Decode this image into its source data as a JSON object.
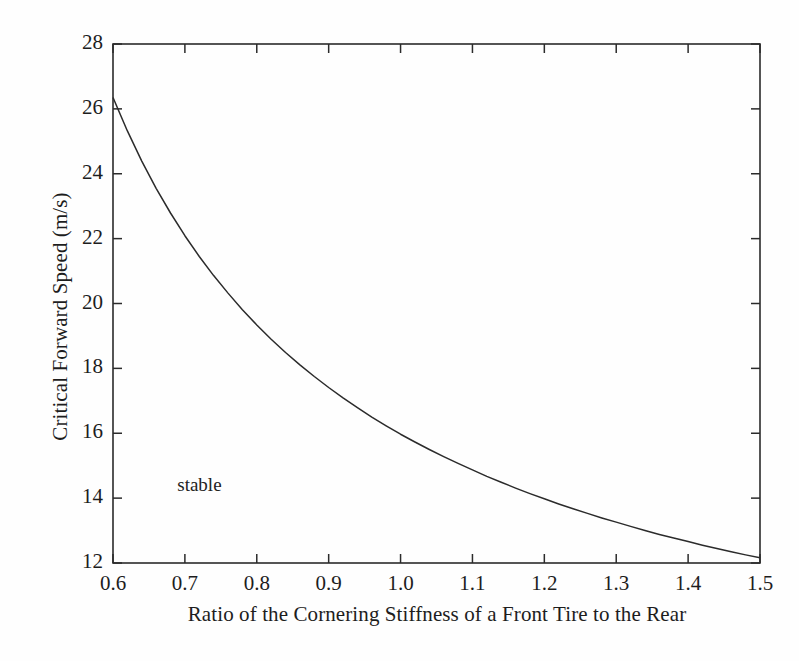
{
  "figure": {
    "background_color": "#fefefe",
    "line_color": "#2b2b2b",
    "axis_color": "#2b2b2b"
  },
  "annotations": [
    {
      "text": "stable",
      "x": 0.72,
      "y": 14.35
    }
  ],
  "chart_data": {
    "type": "line",
    "title": "",
    "xlabel": "Ratio of the Cornering Stiffness of a Front Tire to the Rear",
    "ylabel": "Critical Forward Speed (m/s)",
    "xlim": [
      0.6,
      1.5
    ],
    "ylim": [
      12,
      28
    ],
    "xticks": [
      0.6,
      0.7,
      0.8,
      0.9,
      1.0,
      1.1,
      1.2,
      1.3,
      1.4,
      1.5
    ],
    "xtick_labels": [
      "0.6",
      "0.7",
      "0.8",
      "0.9",
      "1.0",
      "1.1",
      "1.2",
      "1.3",
      "1.4",
      "1.5"
    ],
    "yticks": [
      12,
      14,
      16,
      18,
      20,
      22,
      24,
      26,
      28
    ],
    "ytick_labels": [
      "12",
      "14",
      "16",
      "18",
      "20",
      "22",
      "24",
      "26",
      "28"
    ],
    "grid": false,
    "legend": null,
    "series": [
      {
        "name": "critical forward speed",
        "x": [
          0.6,
          0.62,
          0.64,
          0.66,
          0.68,
          0.7,
          0.72,
          0.74,
          0.76,
          0.78,
          0.8,
          0.82,
          0.84,
          0.86,
          0.88,
          0.9,
          0.92,
          0.94,
          0.96,
          0.98,
          1.0,
          1.02,
          1.04,
          1.06,
          1.08,
          1.1,
          1.12,
          1.14,
          1.16,
          1.18,
          1.2,
          1.22,
          1.24,
          1.26,
          1.28,
          1.3,
          1.32,
          1.34,
          1.36,
          1.38,
          1.4,
          1.42,
          1.44,
          1.46,
          1.48,
          1.5
        ],
        "y": [
          26.35,
          25.32,
          24.39,
          23.55,
          22.79,
          22.09,
          21.45,
          20.86,
          20.32,
          19.81,
          19.34,
          18.9,
          18.49,
          18.11,
          17.75,
          17.41,
          17.09,
          16.79,
          16.5,
          16.23,
          15.97,
          15.73,
          15.5,
          15.28,
          15.07,
          14.87,
          14.67,
          14.49,
          14.31,
          14.14,
          13.98,
          13.82,
          13.67,
          13.53,
          13.39,
          13.26,
          13.13,
          13.0,
          12.88,
          12.77,
          12.66,
          12.55,
          12.45,
          12.35,
          12.25,
          12.16
        ]
      }
    ]
  }
}
